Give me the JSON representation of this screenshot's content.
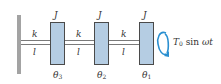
{
  "diagram": {
    "type": "torsional-vibration-system",
    "colors": {
      "disk_fill": "#b5cde3",
      "disk_border": "#4a4a4a",
      "wall": "#a3a3a3",
      "shaft": "#7a7a7a",
      "torque_arrow": "#2a8fd0",
      "text": "#333333"
    },
    "shafts": [
      {
        "stiffness_label": "k",
        "length_label": "l"
      },
      {
        "stiffness_label": "k",
        "length_label": "l"
      },
      {
        "stiffness_label": "k",
        "length_label": "l"
      }
    ],
    "disks": [
      {
        "inertia_label": "J",
        "angle_label": "θ",
        "angle_subscript": "3"
      },
      {
        "inertia_label": "J",
        "angle_label": "θ",
        "angle_subscript": "2"
      },
      {
        "inertia_label": "J",
        "angle_label": "θ",
        "angle_subscript": "1"
      }
    ],
    "torque": {
      "symbol": "T",
      "subscript": "0",
      "function": "sin",
      "argument": "ωt",
      "icon": "circular-arrow-icon"
    }
  }
}
